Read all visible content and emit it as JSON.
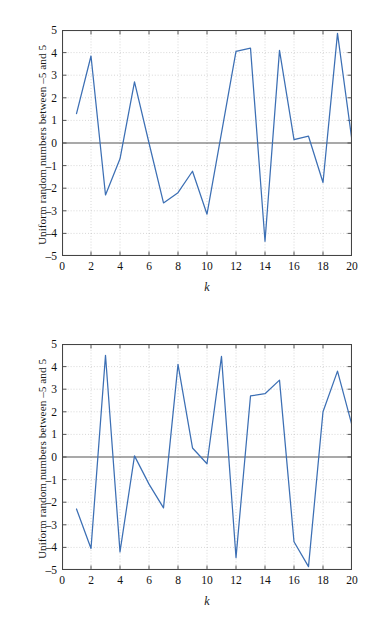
{
  "figure": {
    "ylabel": "Uniform random numbers between –5 and 5",
    "xlabel": "k",
    "line_color": "#3c6fb4",
    "axis_color": "#444444",
    "grid_color": "#b9b9b9",
    "zero_line_color": "#555555",
    "background": "#ffffff"
  },
  "axes": {
    "y_ticks": [
      "5",
      "4",
      "3",
      "2",
      "1",
      "0",
      "–1",
      "–2",
      "–3",
      "–4",
      "–5"
    ],
    "y_tick_values": [
      5,
      4,
      3,
      2,
      1,
      0,
      -1,
      -2,
      -3,
      -4,
      -5
    ],
    "x_ticks": [
      "0",
      "2",
      "4",
      "6",
      "8",
      "10",
      "12",
      "14",
      "16",
      "18",
      "20"
    ],
    "x_tick_values": [
      0,
      2,
      4,
      6,
      8,
      10,
      12,
      14,
      16,
      18,
      20
    ]
  },
  "chart_data": [
    {
      "type": "line",
      "title": "",
      "xlabel": "k",
      "ylabel": "Uniform random numbers between –5 and 5",
      "x": [
        1,
        2,
        3,
        4,
        5,
        6,
        7,
        8,
        9,
        10,
        11,
        12,
        13,
        14,
        15,
        16,
        17,
        18,
        19,
        20
      ],
      "values": [
        1.3,
        3.85,
        -2.3,
        -0.7,
        2.7,
        0.0,
        -2.65,
        -2.2,
        -1.25,
        -3.15,
        0.45,
        4.05,
        4.2,
        -4.35,
        4.1,
        0.15,
        0.3,
        -1.75,
        4.85,
        0.1
      ],
      "xlim": [
        0,
        20
      ],
      "ylim": [
        -5,
        5
      ],
      "grid": true,
      "legend": "none",
      "series_name": "Uniform random numbers"
    },
    {
      "type": "line",
      "title": "",
      "xlabel": "k",
      "ylabel": "Uniform random numbers between –5 and 5",
      "x": [
        1,
        2,
        3,
        4,
        5,
        6,
        7,
        8,
        9,
        10,
        11,
        12,
        13,
        14,
        15,
        16,
        17,
        18,
        19,
        20
      ],
      "values": [
        -2.3,
        -4.05,
        4.5,
        -4.2,
        0.05,
        -1.2,
        -2.25,
        4.1,
        0.4,
        -0.3,
        4.45,
        -4.45,
        2.7,
        2.8,
        3.4,
        -3.75,
        -4.85,
        2.0,
        3.8,
        1.4
      ],
      "xlim": [
        0,
        20
      ],
      "ylim": [
        -5,
        5
      ],
      "grid": true,
      "legend": "none",
      "series_name": "Uniform random numbers"
    }
  ]
}
